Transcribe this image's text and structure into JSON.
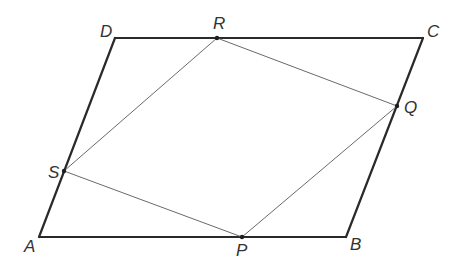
{
  "diagram": {
    "type": "geometry",
    "colors": {
      "outer_stroke": "#2a2a2a",
      "inner_stroke": "#6a6a6a",
      "label": "#333333",
      "background": "#ffffff"
    },
    "outer_shape": {
      "name": "ABCD",
      "vertices": [
        "A",
        "B",
        "C",
        "D"
      ]
    },
    "inner_shape": {
      "name": "PQRS",
      "vertices": [
        "P",
        "Q",
        "R",
        "S"
      ]
    },
    "points": {
      "A": {
        "label": "A",
        "x": 39,
        "y": 237,
        "label_x": 24,
        "label_y": 252
      },
      "B": {
        "label": "B",
        "x": 346,
        "y": 237,
        "label_x": 350,
        "label_y": 250
      },
      "C": {
        "label": "C",
        "x": 423,
        "y": 38,
        "label_x": 427,
        "label_y": 37
      },
      "D": {
        "label": "D",
        "x": 115,
        "y": 38,
        "label_x": 100,
        "label_y": 37
      },
      "P": {
        "label": "P",
        "x": 242,
        "y": 237,
        "label_x": 236,
        "label_y": 256
      },
      "Q": {
        "label": "Q",
        "x": 397,
        "y": 106,
        "label_x": 404,
        "label_y": 113
      },
      "R": {
        "label": "R",
        "x": 217,
        "y": 38,
        "label_x": 213,
        "label_y": 29
      },
      "S": {
        "label": "S",
        "x": 64,
        "y": 171,
        "label_x": 48,
        "label_y": 178
      }
    },
    "segments_outer": [
      [
        "A",
        "B"
      ],
      [
        "B",
        "C"
      ],
      [
        "C",
        "D"
      ],
      [
        "D",
        "A"
      ]
    ],
    "segments_inner": [
      [
        "P",
        "Q"
      ],
      [
        "Q",
        "R"
      ],
      [
        "R",
        "S"
      ],
      [
        "S",
        "P"
      ]
    ],
    "marked_points": [
      "P",
      "Q",
      "R",
      "S"
    ]
  }
}
